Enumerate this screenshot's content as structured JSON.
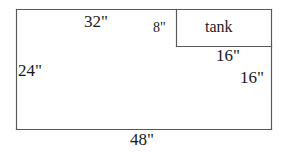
{
  "figure": {
    "type": "geometry-diagram",
    "background_color": "#ffffff",
    "line_color": "#595959",
    "text_color": "#1a1a1a",
    "outer_rect": {
      "label_top": "32\"",
      "label_left": "24\"",
      "label_bottom": "48\"",
      "label_right": "16\""
    },
    "tank_rect": {
      "name": "tank",
      "label_left": "8\"",
      "label_bottom": "16\""
    },
    "labels": {
      "top_width": "32\"",
      "tank_height": "8\"",
      "tank_name": "tank",
      "tank_width": "16\"",
      "right_height": "16\"",
      "left_height": "24\"",
      "bottom_width": "48\""
    }
  }
}
